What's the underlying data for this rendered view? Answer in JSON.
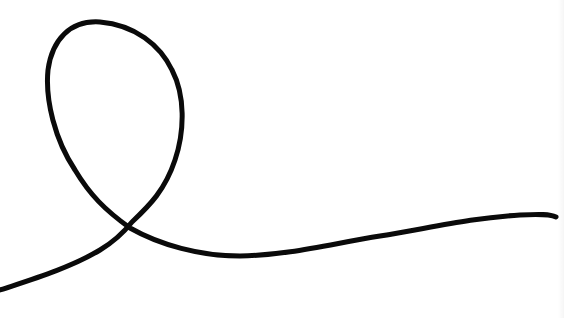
{
  "image": {
    "description": "Hand-drawn single black line forming a loop that crosses itself",
    "background_color": "#ffffff",
    "stroke_color": "#0a0a0a",
    "stroke_width": 5
  },
  "drawing": {
    "path": "M 0 290 C 30 280, 70 268, 100 250 C 115 241, 124 232, 132 222 C 150 205, 165 190, 175 160 C 185 130, 185 95, 172 70 C 160 45, 135 25, 100 22 C 70 20, 52 40, 48 70 C 45 100, 55 140, 75 170 C 90 195, 105 210, 130 228 C 160 245, 200 256, 240 256 C 290 255, 330 244, 380 236 C 430 228, 470 218, 520 215 C 540 214, 550 214, 556 217"
  }
}
